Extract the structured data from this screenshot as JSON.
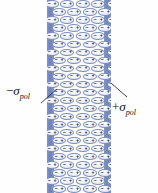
{
  "figure": {
    "background_color": "#fefefe"
  },
  "slab": {
    "fill_color": "#fdfdff",
    "left_px": 47,
    "top_px": 0,
    "width_px": 64,
    "height_px": 193
  },
  "bands": {
    "left": {
      "name": "negative-bound-charge-band",
      "color": "#6d83bd",
      "sign": "negative"
    },
    "right": {
      "name": "positive-bound-charge-band",
      "color": "#6d83bd",
      "sign": "positive"
    }
  },
  "dipole": {
    "negative_sign": "−",
    "positive_sign": "+",
    "outline_color": "#7c8fc1",
    "fill_color": "#f2f5fb",
    "rows": 24,
    "per_row": 4
  },
  "labels": {
    "negative": {
      "prefix": "−",
      "symbol": "σ",
      "subscript": "pol",
      "full": "−σpol"
    },
    "positive": {
      "prefix": "+",
      "symbol": "σ",
      "subscript": "pol",
      "full": "+σpol"
    }
  },
  "leaders": {
    "negative_line_color": "#2f2f3a",
    "positive_line_color": "#2f2f3a"
  }
}
